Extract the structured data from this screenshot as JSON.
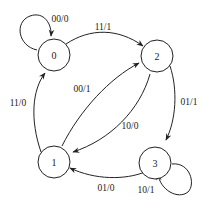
{
  "diagram": {
    "type": "finite-state-machine",
    "nodes": [
      {
        "id": "0",
        "label": "0"
      },
      {
        "id": "1",
        "label": "1"
      },
      {
        "id": "2",
        "label": "2"
      },
      {
        "id": "3",
        "label": "3"
      }
    ],
    "edges": [
      {
        "from": "0",
        "to": "0",
        "label": "00/0"
      },
      {
        "from": "0",
        "to": "2",
        "label": "11/1"
      },
      {
        "from": "1",
        "to": "0",
        "label": "11/0"
      },
      {
        "from": "1",
        "to": "2",
        "label": "00/1"
      },
      {
        "from": "2",
        "to": "1",
        "label": "10/0"
      },
      {
        "from": "2",
        "to": "3",
        "label": "01/1"
      },
      {
        "from": "3",
        "to": "1",
        "label": "01/0"
      },
      {
        "from": "3",
        "to": "3",
        "label": "10/1"
      }
    ]
  }
}
